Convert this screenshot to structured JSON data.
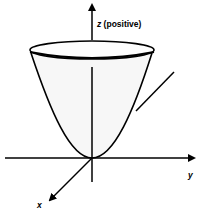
{
  "diagram": {
    "z_label_var": "z",
    "z_label_text": " (positive)",
    "y_label": "y",
    "x_label": "x",
    "colors": {
      "stroke": "#000000",
      "fill": "#f7f7f7",
      "background": "#ffffff"
    }
  }
}
